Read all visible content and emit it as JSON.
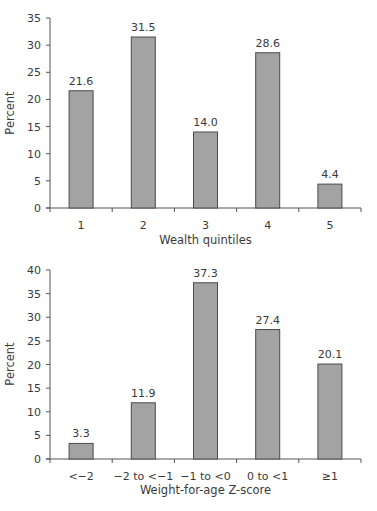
{
  "chart_data": [
    {
      "type": "bar",
      "title": "",
      "categories": [
        "1",
        "2",
        "3",
        "4",
        "5"
      ],
      "values": [
        21.6,
        31.5,
        14.0,
        28.6,
        4.4
      ],
      "value_labels": [
        "21.6",
        "31.5",
        "14.0",
        "28.6",
        "4.4"
      ],
      "xlabel": "Wealth quintiles",
      "ylabel": "Percent",
      "ylim": [
        0,
        35
      ],
      "yticks": [
        0,
        5,
        10,
        15,
        20,
        25,
        30,
        35
      ],
      "grid": false,
      "legend": null,
      "colors": {
        "bar_fill": "#a3a3a3",
        "bar_stroke": "#4a4a4a",
        "axis": "#555555"
      }
    },
    {
      "type": "bar",
      "title": "",
      "categories": [
        "<−2",
        "−2 to <−1",
        "−1 to <0",
        "0 to <1",
        "≥1"
      ],
      "values": [
        3.3,
        11.9,
        37.3,
        27.4,
        20.1
      ],
      "value_labels": [
        "3.3",
        "11.9",
        "37.3",
        "27.4",
        "20.1"
      ],
      "xlabel": "Weight-for-age Z-score",
      "ylabel": "Percent",
      "ylim": [
        0,
        40
      ],
      "yticks": [
        0,
        5,
        10,
        15,
        20,
        25,
        30,
        35,
        40
      ],
      "grid": false,
      "legend": null,
      "colors": {
        "bar_fill": "#a3a3a3",
        "bar_stroke": "#4a4a4a",
        "axis": "#555555"
      }
    }
  ]
}
